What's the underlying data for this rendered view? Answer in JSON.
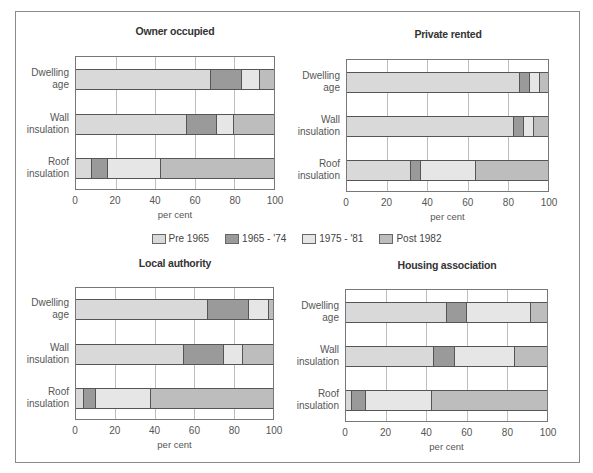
{
  "legend": [
    {
      "label": "Pre 1965",
      "color": "#d9d9d9"
    },
    {
      "label": "1965 - '74",
      "color": "#9a9a9a"
    },
    {
      "label": "1975 - '81",
      "color": "#e6e6e6"
    },
    {
      "label": "Post 1982",
      "color": "#bdbdbd"
    }
  ],
  "axis": {
    "ticks": [
      "0",
      "20",
      "40",
      "60",
      "80",
      "100"
    ],
    "xlabel": "per cent"
  },
  "row_labels": [
    {
      "line1": "Dwelling",
      "line2": "age"
    },
    {
      "line1": "Wall",
      "line2": "insulation"
    },
    {
      "line1": "Roof",
      "line2": "insulation"
    }
  ],
  "chart_data": [
    {
      "type": "bar",
      "orientation": "horizontal",
      "stacked": true,
      "title": "Owner occupied",
      "categories": [
        "Dwelling age",
        "Wall insulation",
        "Roof insulation"
      ],
      "series": [
        {
          "name": "Pre 1965",
          "values": [
            68,
            56,
            8
          ]
        },
        {
          "name": "1965 - '74",
          "values": [
            16,
            15,
            8
          ]
        },
        {
          "name": "1975 - '81",
          "values": [
            9,
            9,
            27
          ]
        },
        {
          "name": "Post 1982",
          "values": [
            7,
            20,
            57
          ]
        }
      ],
      "xlabel": "per cent",
      "ylabel": "",
      "xlim": [
        0,
        100
      ],
      "grid": true
    },
    {
      "type": "bar",
      "orientation": "horizontal",
      "stacked": true,
      "title": "Private rented",
      "categories": [
        "Dwelling age",
        "Wall insulation",
        "Roof insulation"
      ],
      "series": [
        {
          "name": "Pre 1965",
          "values": [
            86,
            83,
            32
          ]
        },
        {
          "name": "1965 - '74",
          "values": [
            5,
            5,
            5
          ]
        },
        {
          "name": "1975 - '81",
          "values": [
            5,
            5,
            27
          ]
        },
        {
          "name": "Post 1982",
          "values": [
            4,
            7,
            36
          ]
        }
      ],
      "xlabel": "per cent",
      "ylabel": "",
      "xlim": [
        0,
        100
      ],
      "grid": true
    },
    {
      "type": "bar",
      "orientation": "horizontal",
      "stacked": true,
      "title": "Local authority",
      "categories": [
        "Dwelling age",
        "Wall insulation",
        "Roof insulation"
      ],
      "series": [
        {
          "name": "Pre 1965",
          "values": [
            67,
            55,
            4
          ]
        },
        {
          "name": "1965 - '74",
          "values": [
            21,
            20,
            6
          ]
        },
        {
          "name": "1975 - '81",
          "values": [
            10,
            10,
            28
          ]
        },
        {
          "name": "Post 1982",
          "values": [
            2,
            15,
            62
          ]
        }
      ],
      "xlabel": "per cent",
      "ylabel": "",
      "xlim": [
        0,
        100
      ],
      "grid": true
    },
    {
      "type": "bar",
      "orientation": "horizontal",
      "stacked": true,
      "title": "Housing association",
      "categories": [
        "Dwelling age",
        "Wall insulation",
        "Roof insulation"
      ],
      "series": [
        {
          "name": "Pre 1965",
          "values": [
            50,
            44,
            3
          ]
        },
        {
          "name": "1965 - '74",
          "values": [
            10,
            10,
            7
          ]
        },
        {
          "name": "1975 - '81",
          "values": [
            32,
            30,
            33
          ]
        },
        {
          "name": "Post 1982",
          "values": [
            8,
            16,
            57
          ]
        }
      ],
      "xlabel": "per cent",
      "ylabel": "",
      "xlim": [
        0,
        100
      ],
      "grid": true
    }
  ]
}
